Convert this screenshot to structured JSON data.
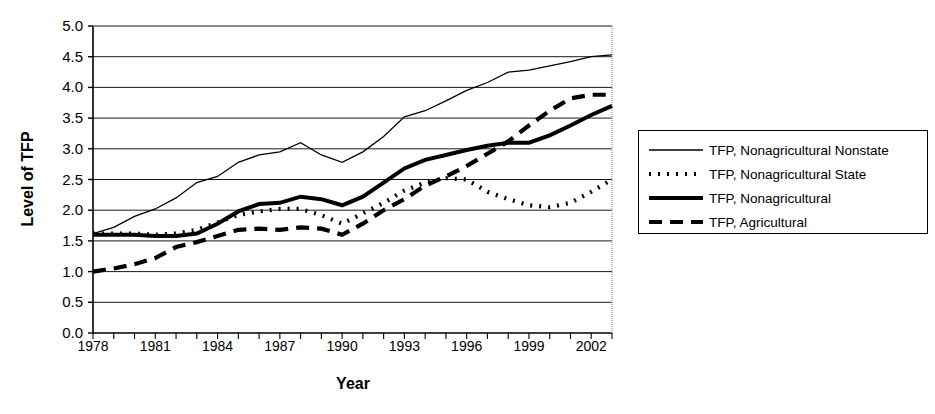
{
  "chart_data": {
    "type": "line",
    "title": "",
    "xlabel": "Year",
    "ylabel": "Level of TFP",
    "xlim": [
      1978,
      2003
    ],
    "ylim": [
      0.0,
      5.0
    ],
    "grid": true,
    "legend_position": "right",
    "x": [
      1978,
      1979,
      1980,
      1981,
      1982,
      1983,
      1984,
      1985,
      1986,
      1987,
      1988,
      1989,
      1990,
      1991,
      1992,
      1993,
      1994,
      1995,
      1996,
      1997,
      1998,
      1999,
      2000,
      2001,
      2002,
      2003
    ],
    "y_ticks": [
      "0.0",
      "0.5",
      "1.0",
      "1.5",
      "2.0",
      "2.5",
      "3.0",
      "3.5",
      "4.0",
      "4.5",
      "5.0"
    ],
    "x_ticks": [
      "1978",
      "1981",
      "1984",
      "1987",
      "1990",
      "1993",
      "1996",
      "1999",
      "2002"
    ],
    "series": [
      {
        "name": "TFP, Nonagricultural Nonstate",
        "style": "thin-solid",
        "values": [
          1.62,
          1.72,
          1.9,
          2.02,
          2.2,
          2.45,
          2.55,
          2.78,
          2.9,
          2.95,
          3.1,
          2.9,
          2.78,
          2.95,
          3.2,
          3.52,
          3.62,
          3.78,
          3.95,
          4.08,
          4.25,
          4.28,
          4.35,
          4.42,
          4.5,
          4.53
        ]
      },
      {
        "name": "TFP, Nonagricultural State",
        "style": "dotted",
        "values": [
          1.62,
          1.62,
          1.62,
          1.6,
          1.62,
          1.68,
          1.8,
          1.92,
          1.98,
          2.02,
          2.02,
          1.92,
          1.78,
          1.95,
          2.12,
          2.32,
          2.45,
          2.52,
          2.5,
          2.3,
          2.18,
          2.08,
          2.05,
          2.12,
          2.3,
          2.5
        ]
      },
      {
        "name": "TFP, Nonagricultural",
        "style": "thick-solid",
        "values": [
          1.6,
          1.6,
          1.6,
          1.58,
          1.58,
          1.62,
          1.78,
          1.98,
          2.1,
          2.12,
          2.22,
          2.18,
          2.08,
          2.22,
          2.45,
          2.68,
          2.82,
          2.9,
          2.98,
          3.05,
          3.1,
          3.1,
          3.22,
          3.38,
          3.55,
          3.7
        ]
      },
      {
        "name": "TFP, Agricultural",
        "style": "dashed",
        "values": [
          1.0,
          1.05,
          1.12,
          1.22,
          1.4,
          1.48,
          1.58,
          1.68,
          1.7,
          1.68,
          1.72,
          1.7,
          1.6,
          1.78,
          2.0,
          2.18,
          2.4,
          2.55,
          2.72,
          2.92,
          3.12,
          3.38,
          3.62,
          3.82,
          3.88,
          3.88
        ]
      }
    ]
  },
  "legend": {
    "items": [
      {
        "label": "TFP, Nonagricultural Nonstate"
      },
      {
        "label": "TFP, Nonagricultural State"
      },
      {
        "label": "TFP, Nonagricultural"
      },
      {
        "label": "TFP, Agricultural"
      }
    ]
  },
  "colors": {
    "line": "#000000",
    "grid": "#000000",
    "background": "#ffffff"
  }
}
